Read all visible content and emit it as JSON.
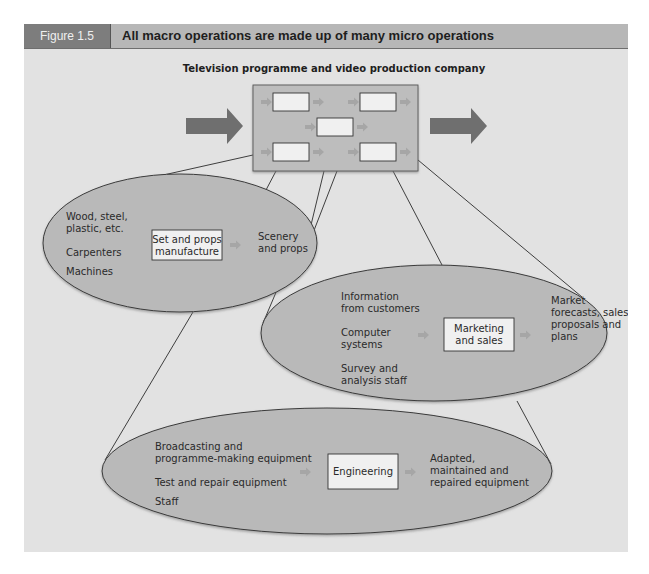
{
  "figure": {
    "label": "Figure 1.5",
    "title": "All macro operations are made up of many micro operations",
    "subtitle": "Television programme and video production company"
  },
  "colors": {
    "panel_bg": "#e2e2e2",
    "header_bg": "#b7b7b7",
    "label_bg": "#7d7d7d",
    "ellipse_fill": "#b9b9b9",
    "macro_box_fill": "#bdbdbd",
    "micro_box_fill": "#f0f0f0",
    "big_arrow": "#6f6f6f",
    "small_arrow": "#a6a6a6",
    "line": "#2b2b2b"
  },
  "macro_operation": {
    "icon": "macro-operation-box",
    "micro_operation_count": 5,
    "input_arrow_icon": "arrow-right-icon",
    "output_arrow_icon": "arrow-right-icon"
  },
  "micro_operations": [
    {
      "name": "Set and props manufacture",
      "process_lines": [
        "Set and props",
        "manufacture"
      ],
      "inputs": [
        {
          "lines": [
            "Wood, steel,",
            "plastic, etc."
          ]
        },
        {
          "lines": [
            "Carpenters"
          ]
        },
        {
          "lines": [
            "Machines"
          ]
        }
      ],
      "output_lines": [
        "Scenery",
        "and props"
      ]
    },
    {
      "name": "Marketing and sales",
      "process_lines": [
        "Marketing",
        "and sales"
      ],
      "inputs": [
        {
          "lines": [
            "Information",
            "from customers"
          ]
        },
        {
          "lines": [
            "Computer",
            "systems"
          ]
        },
        {
          "lines": [
            "Survey and",
            "analysis staff"
          ]
        }
      ],
      "output_lines": [
        "Market",
        "forecasts, sales",
        "proposals and",
        "plans"
      ]
    },
    {
      "name": "Engineering",
      "process_lines": [
        "Engineering"
      ],
      "inputs": [
        {
          "lines": [
            "Broadcasting and",
            "programme-making equipment"
          ]
        },
        {
          "lines": [
            "Test and repair equipment"
          ]
        },
        {
          "lines": [
            "Staff"
          ]
        }
      ],
      "output_lines": [
        "Adapted,",
        "maintained and",
        "repaired equipment"
      ]
    }
  ]
}
